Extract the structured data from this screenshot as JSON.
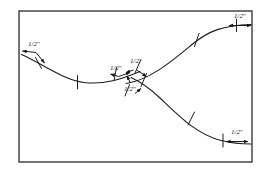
{
  "figure": {
    "background_color": "#ffffff",
    "frame": {
      "name": "drawing-border",
      "x": 19,
      "y": 11,
      "width": 233,
      "height": 151,
      "stroke_color": "#3a3a3a",
      "stroke_width": 1.4
    },
    "line_color": "#1c1c1c",
    "curve_stroke_width": 1.1,
    "tick_stroke_width": 1.0,
    "curves": [
      {
        "name": "left-descending-curve",
        "path": "M 21.5 54.5 C 42 63.5, 62 79.5, 84 82.5 C 104 85, 122 79, 140 71.5"
      },
      {
        "name": "upper-right-ascending-curve",
        "path": "M 126 83.5 C 150 80, 172 61, 192 44.5 C 209 30.5, 223 25.5, 251 24.5"
      },
      {
        "name": "lower-right-descending-curve",
        "path": "M 131 77.5 C 142 82.5, 150 88.5, 160 98 C 178 115, 196 134, 221 140.5 C 233 143.5, 243 144, 251 144"
      }
    ],
    "tick_marks": [
      {
        "name": "tick-left-curve-1",
        "x1": 35.5,
        "y1": 57.5,
        "x2": 41.5,
        "y2": 68.5
      },
      {
        "name": "tick-left-curve-2",
        "x1": 77.5,
        "y1": 75.5,
        "x2": 77.5,
        "y2": 89.0
      },
      {
        "name": "tick-upper-curve-1",
        "x1": 199.0,
        "y1": 33.5,
        "x2": 194.5,
        "y2": 46.5
      },
      {
        "name": "tick-upper-curve-2",
        "x1": 236.5,
        "y1": 19.0,
        "x2": 236.5,
        "y2": 31.5
      },
      {
        "name": "tick-lower-curve-1",
        "x1": 194.5,
        "y1": 112.0,
        "x2": 188.0,
        "y2": 125.0
      },
      {
        "name": "tick-lower-curve-2",
        "x1": 223.0,
        "y1": 134.0,
        "x2": 223.0,
        "y2": 147.0
      },
      {
        "name": "tick-center-cluster-1",
        "x1": 116.5,
        "y1": 67.5,
        "x2": 114.0,
        "y2": 80.5
      },
      {
        "name": "tick-center-cluster-2",
        "x1": 140.5,
        "y1": 60.5,
        "x2": 135.0,
        "y2": 73.0
      },
      {
        "name": "tick-center-cluster-3",
        "x1": 146.5,
        "y1": 73.5,
        "x2": 141.0,
        "y2": 86.5
      },
      {
        "name": "tick-center-cluster-4",
        "x1": 129.5,
        "y1": 84.5,
        "x2": 125.0,
        "y2": 96.0
      }
    ],
    "dimension_callouts": [
      {
        "name": "dimension-callout-left",
        "value": "1/2",
        "unit": "\"",
        "label_x": 28,
        "label_y": 41,
        "arrows": [
          {
            "x1": 36.0,
            "y1": 52.5,
            "x2": 22.5,
            "y2": 51.0
          },
          {
            "x1": 36.0,
            "y1": 52.5,
            "x2": 44.5,
            "y2": 63.0
          }
        ]
      },
      {
        "name": "dimension-callout-top-right",
        "value": "1/2",
        "unit": "\"",
        "label_x": 234,
        "label_y": 13,
        "arrows": [
          {
            "x1": 231.0,
            "y1": 25.5,
            "x2": 251.0,
            "y2": 25.5
          },
          {
            "x1": 240.0,
            "y1": 25.5,
            "x2": 229.0,
            "y2": 25.5
          }
        ]
      },
      {
        "name": "dimension-callout-center-left",
        "value": "1/2",
        "unit": "\"",
        "label_x": 110,
        "label_y": 65,
        "arrows": [
          {
            "x1": 118.5,
            "y1": 76.5,
            "x2": 110.5,
            "y2": 74.0
          },
          {
            "x1": 118.5,
            "y1": 76.5,
            "x2": 130.0,
            "y2": 72.5
          }
        ]
      },
      {
        "name": "dimension-callout-center-right",
        "value": "1/2",
        "unit": "\"",
        "label_x": 130,
        "label_y": 58,
        "arrows": [
          {
            "x1": 133.5,
            "y1": 70.0,
            "x2": 126.0,
            "y2": 72.5
          },
          {
            "x1": 136.5,
            "y1": 70.0,
            "x2": 146.5,
            "y2": 76.5
          }
        ]
      },
      {
        "name": "dimension-callout-center-below",
        "value": "1/2",
        "unit": "\"",
        "label_x": 124,
        "label_y": 86,
        "arrows": [
          {
            "x1": 130.5,
            "y1": 83.0,
            "x2": 127.0,
            "y2": 76.0
          },
          {
            "x1": 135.0,
            "y1": 93.5,
            "x2": 141.0,
            "y2": 88.5
          }
        ]
      },
      {
        "name": "dimension-callout-bottom-right",
        "value": "1/2",
        "unit": "\"",
        "label_x": 231,
        "label_y": 129,
        "arrows": [
          {
            "x1": 228.0,
            "y1": 141.5,
            "x2": 248.0,
            "y2": 141.5
          },
          {
            "x1": 238.0,
            "y1": 141.5,
            "x2": 226.5,
            "y2": 141.5
          }
        ]
      }
    ]
  }
}
